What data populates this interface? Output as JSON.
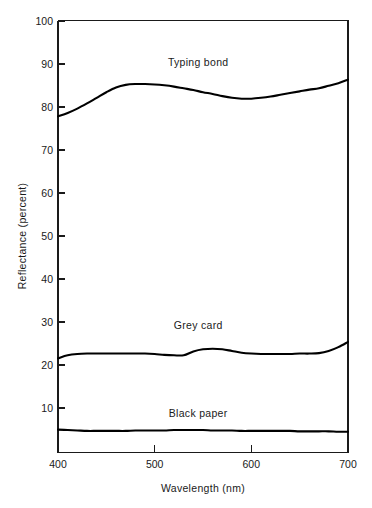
{
  "chart_data": {
    "type": "line",
    "title": "",
    "subtitle": "",
    "xlabel": "Wavelength (nm)",
    "ylabel": "Reflectance (percent)",
    "xlim": [
      400,
      700
    ],
    "ylim": [
      0,
      100
    ],
    "xticks": [
      400,
      500,
      600,
      700
    ],
    "xtick_labels": [
      "400",
      "500",
      "600",
      "700"
    ],
    "yticks": [
      10,
      20,
      30,
      40,
      50,
      60,
      70,
      80,
      90,
      100
    ],
    "ytick_labels": [
      "10",
      "20",
      "30",
      "40",
      "50",
      "60",
      "70",
      "80",
      "90",
      "100"
    ],
    "grid": false,
    "legend": "inline-labels",
    "legend_position": "inline",
    "x": [
      400,
      410,
      420,
      430,
      440,
      450,
      460,
      470,
      480,
      490,
      500,
      510,
      520,
      530,
      540,
      550,
      560,
      570,
      580,
      590,
      600,
      610,
      620,
      630,
      640,
      650,
      660,
      670,
      680,
      690,
      700
    ],
    "series": [
      {
        "name": "Typing bond",
        "label": "Typing bond",
        "label_x": 545,
        "label_y": 89.5,
        "color": "#000000",
        "values": [
          77.8,
          78.6,
          79.6,
          80.8,
          82.1,
          83.4,
          84.5,
          85.1,
          85.3,
          85.3,
          85.2,
          85.0,
          84.7,
          84.3,
          83.9,
          83.4,
          83.0,
          82.5,
          82.1,
          81.9,
          81.9,
          82.1,
          82.4,
          82.8,
          83.2,
          83.6,
          84.0,
          84.3,
          84.9,
          85.5,
          86.3
        ]
      },
      {
        "name": "Grey card",
        "label": "Grey card",
        "label_x": 545,
        "label_y": 28.6,
        "color": "#000000",
        "values": [
          21.8,
          22.5,
          22.8,
          22.9,
          22.9,
          22.9,
          22.9,
          22.9,
          22.9,
          22.9,
          22.8,
          22.6,
          22.5,
          22.5,
          23.4,
          23.9,
          24.0,
          23.9,
          23.5,
          23.1,
          22.9,
          22.8,
          22.8,
          22.8,
          22.8,
          22.9,
          22.9,
          23.0,
          23.5,
          24.4,
          25.6
        ]
      },
      {
        "name": "Black paper",
        "label": "Black paper",
        "label_x": 545,
        "label_y": 8.2,
        "color": "#000000",
        "values": [
          5.3,
          5.2,
          5.1,
          5.0,
          5.0,
          5.0,
          5.0,
          5.0,
          5.1,
          5.1,
          5.1,
          5.1,
          5.2,
          5.2,
          5.2,
          5.2,
          5.1,
          5.1,
          5.1,
          5.0,
          5.0,
          5.0,
          5.0,
          5.0,
          5.0,
          4.9,
          4.9,
          4.9,
          4.9,
          4.8,
          4.8
        ]
      }
    ]
  },
  "axes": {
    "x_axis_title": "Wavelength (nm)",
    "y_axis_title": "Reflectance (percent)"
  },
  "colors": {
    "background": "#ffffff",
    "ink": "#000000",
    "axis": "#1a1a1a"
  }
}
